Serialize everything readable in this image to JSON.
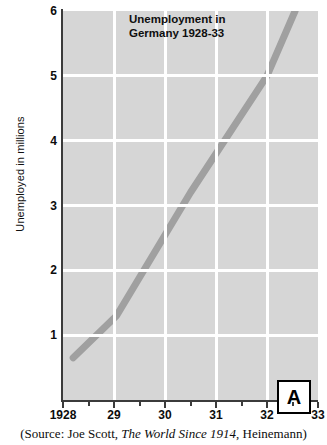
{
  "chart_data": {
    "type": "line",
    "title": "Unemployment in Germany 1928-33",
    "title_line1": "Unemployment in",
    "title_line2": "Germany 1928-33",
    "xlabel": "",
    "ylabel": "Unemployed in millions",
    "xlim": [
      1928,
      1933
    ],
    "ylim": [
      0,
      6
    ],
    "xticks": [
      1928,
      1929,
      1930,
      1931,
      1932,
      1933
    ],
    "xticklabels": [
      "1928",
      "29",
      "30",
      "31",
      "32",
      "33"
    ],
    "yticks": [
      1,
      2,
      3,
      4,
      5,
      6
    ],
    "yticklabels": [
      "1",
      "2",
      "3",
      "4",
      "5",
      "6"
    ],
    "grid": true,
    "legend": false,
    "series": [
      {
        "name": "Unemployed in Germany",
        "color": "#a0a0a0",
        "x": [
          1928.2,
          1929.05,
          1930.5,
          1932.0,
          1932.55
        ],
        "values": [
          0.65,
          1.3,
          3.2,
          5.0,
          6.0
        ]
      }
    ],
    "annotations": [
      {
        "name": "panel-label",
        "text": "A"
      }
    ],
    "source_prefix": "(Source: Joe Scott, ",
    "source_italic": "The World Since 1914",
    "source_suffix": ", Heinemann)",
    "colors": {
      "plot_background": "#d6d6d6",
      "gridline": "#ffffff",
      "axis": "#3b3b3b",
      "line": "#a0a0a0",
      "text": "#0c0c0c",
      "page_background": "#ffffff"
    }
  }
}
